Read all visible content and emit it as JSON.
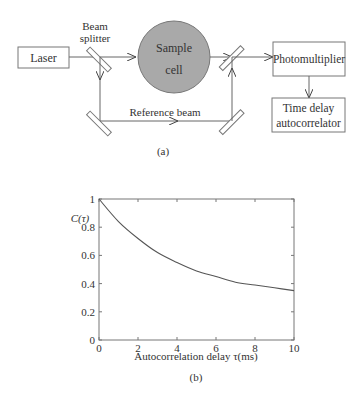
{
  "figure_a": {
    "caption": "(a)",
    "laser_label": "Laser",
    "beam_splitter_label_line1": "Beam",
    "beam_splitter_label_line2": "splitter",
    "sample_cell_label_line1": "Sample",
    "sample_cell_label_line2": "cell",
    "reference_beam_label": "Reference beam",
    "photomultiplier_label": "Photomultiplier",
    "autocorrelator_label_line1": "Time delay",
    "autocorrelator_label_line2": "autocorrelator",
    "sample_fill_color": "#a9a9a9"
  },
  "figure_b": {
    "caption": "(b)"
  },
  "chart_data": {
    "type": "line",
    "title": "",
    "xlabel": "Autocorrelation delay τ(ms)",
    "ylabel": "C(τ)",
    "xlim": [
      0,
      10
    ],
    "ylim": [
      0,
      1
    ],
    "xticks": [
      "0",
      "2",
      "4",
      "6",
      "8",
      "10"
    ],
    "yticks": [
      "0",
      "0.2",
      "0.4",
      "0.6",
      "0.8",
      "1"
    ],
    "grid": false,
    "legend": null,
    "series": [
      {
        "name": "C(τ)",
        "x": [
          0,
          1,
          2,
          3,
          4,
          5,
          6,
          7,
          8,
          9,
          10
        ],
        "values": [
          1.0,
          0.84,
          0.72,
          0.62,
          0.55,
          0.49,
          0.45,
          0.41,
          0.39,
          0.37,
          0.35
        ]
      }
    ]
  }
}
